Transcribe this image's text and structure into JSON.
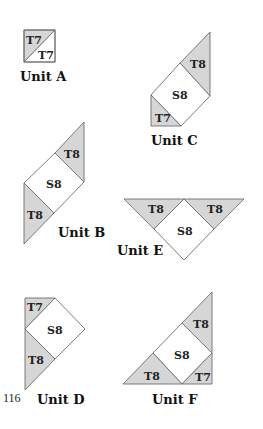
{
  "page_number": "116",
  "units": [
    {
      "id": "A",
      "label": "Unit A",
      "pieces": [
        "T7",
        "T7"
      ]
    },
    {
      "id": "B",
      "label": "Unit B",
      "pieces": [
        "T8",
        "S8",
        "T8"
      ]
    },
    {
      "id": "C",
      "label": "Unit C",
      "pieces": [
        "T8",
        "S8",
        "T7"
      ]
    },
    {
      "id": "D",
      "label": "Unit D",
      "pieces": [
        "T7",
        "S8",
        "T8"
      ]
    },
    {
      "id": "E",
      "label": "Unit E",
      "pieces": [
        "T8",
        "S8",
        "T8"
      ]
    },
    {
      "id": "F",
      "label": "Unit F",
      "pieces": [
        "T8",
        "S8",
        "T8",
        "T7"
      ]
    }
  ],
  "colors": {
    "triangle_fill": "#d6d6d6",
    "square_fill": "#ffffff",
    "outline": "#6e6e6e"
  }
}
